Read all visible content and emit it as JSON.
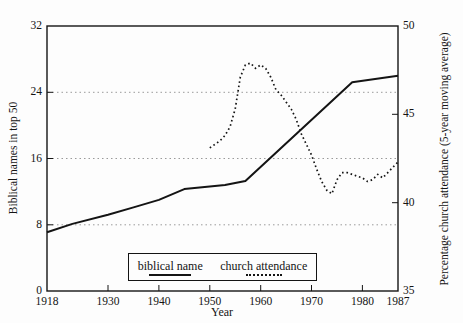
{
  "chart_data": {
    "type": "line",
    "title": "",
    "xlabel": "Year",
    "ylabel_left": "Biblical names in top 50",
    "ylabel_right": "Percentage church attendance (5-year moving average)",
    "xlim": [
      1918,
      1987
    ],
    "ylim_left": [
      0,
      32
    ],
    "ylim_right": [
      35,
      50
    ],
    "x_ticks": [
      1918,
      1930,
      1940,
      1950,
      1960,
      1970,
      1980,
      1987
    ],
    "y_ticks_left": [
      0,
      8,
      16,
      24,
      32
    ],
    "y_ticks_right": [
      35,
      40,
      45,
      50
    ],
    "gridlines_at_left_values": [
      8,
      16,
      24
    ],
    "grid": "horizontal-dotted",
    "legend_position": "inside-bottom",
    "line_color": "#141414",
    "grid_color": "#9a9a9a",
    "legend": [
      {
        "label": "biblical name",
        "style": "solid",
        "axis": "left"
      },
      {
        "label": "church attendance",
        "style": "dotted",
        "axis": "right"
      }
    ],
    "series": [
      {
        "name": "biblical name",
        "axis": "left",
        "style": "solid",
        "points": [
          [
            1918,
            7.1
          ],
          [
            1923,
            8.1
          ],
          [
            1930,
            9.2
          ],
          [
            1935,
            10.1
          ],
          [
            1940,
            11.0
          ],
          [
            1945,
            12.3
          ],
          [
            1953,
            12.8
          ],
          [
            1957,
            13.3
          ],
          [
            1978,
            25.2
          ],
          [
            1987,
            26.0
          ]
        ]
      },
      {
        "name": "church attendance",
        "axis": "right",
        "style": "dotted",
        "points": [
          [
            1950,
            43.1
          ],
          [
            1951,
            43.3
          ],
          [
            1952,
            43.5
          ],
          [
            1953,
            43.8
          ],
          [
            1954,
            44.3
          ],
          [
            1955,
            45.3
          ],
          [
            1956,
            47.1
          ],
          [
            1957,
            47.8
          ],
          [
            1958,
            47.9
          ],
          [
            1959,
            47.6
          ],
          [
            1960,
            47.8
          ],
          [
            1961,
            47.6
          ],
          [
            1962,
            47.1
          ],
          [
            1963,
            46.4
          ],
          [
            1964,
            46.1
          ],
          [
            1965,
            45.7
          ],
          [
            1966,
            45.3
          ],
          [
            1967,
            44.7
          ],
          [
            1968,
            43.9
          ],
          [
            1969,
            43.3
          ],
          [
            1970,
            42.7
          ],
          [
            1971,
            41.9
          ],
          [
            1972,
            41.2
          ],
          [
            1973,
            40.7
          ],
          [
            1974,
            40.5
          ],
          [
            1975,
            41.3
          ],
          [
            1976,
            41.7
          ],
          [
            1977,
            41.7
          ],
          [
            1978,
            41.6
          ],
          [
            1979,
            41.5
          ],
          [
            1980,
            41.4
          ],
          [
            1981,
            41.2
          ],
          [
            1982,
            41.3
          ],
          [
            1983,
            41.6
          ],
          [
            1984,
            41.4
          ],
          [
            1985,
            41.7
          ],
          [
            1986,
            42.0
          ],
          [
            1987,
            42.3
          ]
        ]
      }
    ]
  }
}
